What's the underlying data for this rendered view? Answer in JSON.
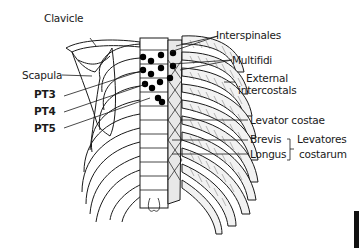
{
  "figure": {
    "colors": {
      "ink": "#1a1a1a",
      "background": "#ffffff",
      "marker": "#000000"
    }
  },
  "labels": {
    "clavicle": "Clavicle",
    "scapula": "Scapula",
    "pt3": "PT3",
    "pt4": "PT4",
    "pt5": "PT5",
    "interspinales": "Interspinales",
    "multifidi": "Multifidi",
    "external_intercostals_1": "External",
    "external_intercostals_2": "intercostals",
    "levator_costae": "Levator costae",
    "brevis": "Brevis",
    "longus": "Longus",
    "levatores_costarum_1": "Levatores",
    "levatores_costarum_2": "costarum"
  }
}
